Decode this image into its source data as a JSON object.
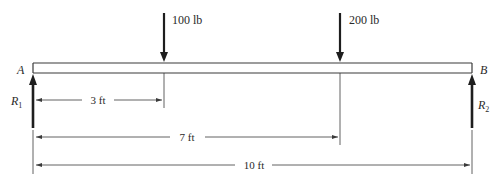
{
  "diagram": {
    "type": "simply-supported-beam",
    "colors": {
      "line": "#3a3a3a",
      "arrow": "#1e1e1e",
      "text": "#2a2a2a"
    },
    "supports": {
      "left": {
        "label": "A",
        "reaction": "R",
        "reaction_sub": "1"
      },
      "right": {
        "label": "B",
        "reaction": "R",
        "reaction_sub": "2"
      }
    },
    "loads": [
      {
        "label": "100 lb",
        "position_ft": 3
      },
      {
        "label": "200 lb",
        "position_ft": 7
      }
    ],
    "dimensions": [
      {
        "label": "3 ft",
        "from_ft": 0,
        "to_ft": 3
      },
      {
        "label": "7 ft",
        "from_ft": 0,
        "to_ft": 7
      },
      {
        "label": "10 ft",
        "from_ft": 0,
        "to_ft": 10
      }
    ],
    "beam_length_ft": 10
  }
}
